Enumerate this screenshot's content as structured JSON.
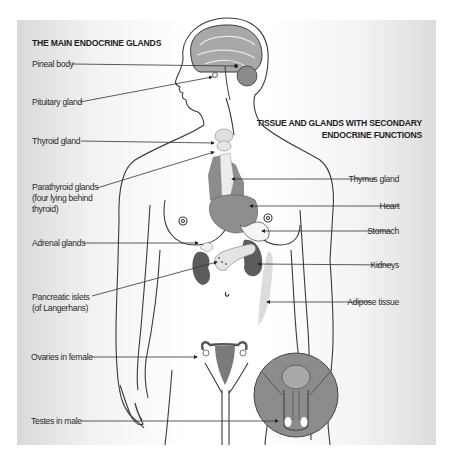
{
  "diagram": {
    "title_main": "THE MAIN ENDOCRINE GLANDS",
    "title_secondary_line1": "TISSUE AND GLANDS WITH SECONDARY",
    "title_secondary_line2": "ENDOCRINE FUNCTIONS",
    "left_labels": [
      {
        "id": "pineal",
        "text": "Pineal body"
      },
      {
        "id": "pituitary",
        "text": "Pituitary gland"
      },
      {
        "id": "thyroid",
        "text": "Thyroid gland"
      },
      {
        "id": "parathyroid",
        "lines": [
          "Parathyroid glands",
          "(four lying behind",
          "thyroid)"
        ]
      },
      {
        "id": "adrenal",
        "text": "Adrenal glands"
      },
      {
        "id": "pancreatic",
        "lines": [
          "Pancreatic islets",
          "(of Langerhans)"
        ]
      },
      {
        "id": "ovaries",
        "text": "Ovaries in female"
      },
      {
        "id": "testes",
        "text": "Testes in male"
      }
    ],
    "right_labels": [
      {
        "id": "thymus",
        "text": "Thymus gland"
      },
      {
        "id": "heart",
        "text": "Heart"
      },
      {
        "id": "stomach",
        "text": "Stomach"
      },
      {
        "id": "kidneys",
        "text": "Kidneys"
      },
      {
        "id": "adipose",
        "text": "Adipose tissue"
      }
    ],
    "colors": {
      "outline": "#3a3a3a",
      "organ_dark": "#6b6b6b",
      "organ_mid": "#9a9a9a",
      "organ_light": "#c8c8c8",
      "gland_pale": "#e0e0e0",
      "leader_line": "#333333"
    }
  }
}
